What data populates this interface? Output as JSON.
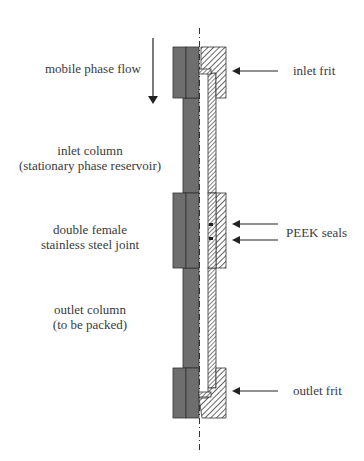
{
  "labels": {
    "mobile_phase_flow": "mobile phase flow",
    "inlet_column_line1": "inlet column",
    "inlet_column_line2": "(stationary phase reservoir)",
    "joint_line1": "double female",
    "joint_line2": "stainless steel joint",
    "outlet_column_line1": "outlet column",
    "outlet_column_line2": "(to be packed)",
    "inlet_frit": "inlet frit",
    "peek_seals": "PEEK seals",
    "outlet_frit": "outlet frit"
  },
  "colors": {
    "steel_gray": "#6e6e6e",
    "outline": "#333333",
    "hatch": "#333333",
    "background": "#ffffff"
  }
}
